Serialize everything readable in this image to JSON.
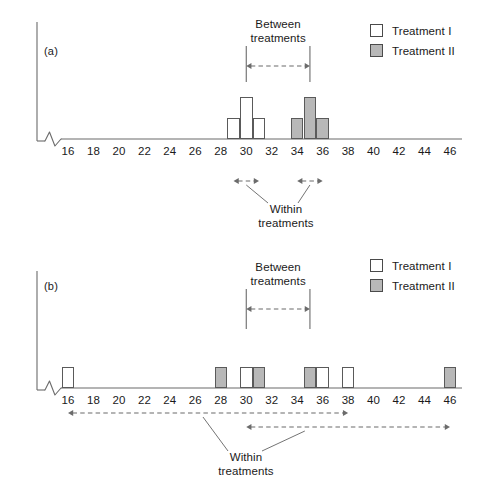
{
  "figure": {
    "colors": {
      "treatment_1_fill": "#ffffff",
      "treatment_2_fill": "#b8b8b8",
      "stroke": "#5a5a5a",
      "axis": "#6b6b6b",
      "background": "#ffffff"
    }
  },
  "legend": {
    "items": [
      {
        "label": "Treatment I",
        "swatch": "white-square-swatch"
      },
      {
        "label": "Treatment II",
        "swatch": "gray-square-swatch"
      }
    ]
  },
  "annotations": {
    "between_line1": "Between",
    "between_line2": "treatments",
    "within_line1": "Within",
    "within_line2": "treatments"
  },
  "panels": [
    {
      "id": "a",
      "label": "(a)",
      "axis": {
        "min": 16,
        "max": 46,
        "step": 2,
        "ticks": [
          16,
          18,
          20,
          22,
          24,
          26,
          28,
          30,
          32,
          34,
          36,
          38,
          40,
          42,
          44,
          46
        ],
        "broken": true,
        "break_symbol": "zigzag"
      },
      "between_arrow": {
        "from": 30,
        "to": 35
      },
      "within_arrows": [
        {
          "from": 29,
          "to": 31
        },
        {
          "from": 34,
          "to": 36
        }
      ]
    },
    {
      "id": "b",
      "label": "(b)",
      "axis": {
        "min": 16,
        "max": 46,
        "step": 2,
        "ticks": [
          16,
          18,
          20,
          22,
          24,
          26,
          28,
          30,
          32,
          34,
          36,
          38,
          40,
          42,
          44,
          46
        ],
        "broken": true,
        "break_symbol": "zigzag"
      },
      "between_arrow": {
        "from": 30,
        "to": 35
      },
      "within_arrows": [
        {
          "from": 16,
          "to": 38
        },
        {
          "from": 30,
          "to": 46
        }
      ]
    }
  ],
  "chart_data": {
    "type": "bar",
    "title": "",
    "xlabel": "",
    "ylabel": "",
    "xlim": [
      15,
      47
    ],
    "ylim": [
      0,
      3
    ],
    "grid": false,
    "legend_position": "top-right",
    "axis_break": true,
    "panels": [
      {
        "panel": "a",
        "label": "(a)",
        "description": "Small within-treatment variability; two tight clusters",
        "series": [
          {
            "name": "Treatment I",
            "fill": "#ffffff",
            "x": [
              29,
              30,
              31
            ],
            "values": [
              1,
              2,
              1
            ]
          },
          {
            "name": "Treatment II",
            "fill": "#b8b8b8",
            "x": [
              34,
              35,
              36
            ],
            "values": [
              1,
              2,
              1
            ]
          }
        ],
        "between_treatments_span": [
          30,
          35
        ],
        "within_treatments_spans": [
          [
            29,
            31
          ],
          [
            34,
            36
          ]
        ]
      },
      {
        "panel": "b",
        "label": "(b)",
        "description": "Large within-treatment variability; scores widely scattered",
        "series": [
          {
            "name": "Treatment I",
            "fill": "#ffffff",
            "x": [
              16,
              30,
              36,
              38
            ],
            "values": [
              1,
              1,
              1,
              1
            ]
          },
          {
            "name": "Treatment II",
            "fill": "#b8b8b8",
            "x": [
              28,
              31,
              35,
              46
            ],
            "values": [
              1,
              1,
              1,
              1
            ]
          }
        ],
        "between_treatments_span": [
          30,
          35
        ],
        "within_treatments_spans": [
          [
            16,
            38
          ],
          [
            30,
            46
          ]
        ]
      }
    ]
  }
}
